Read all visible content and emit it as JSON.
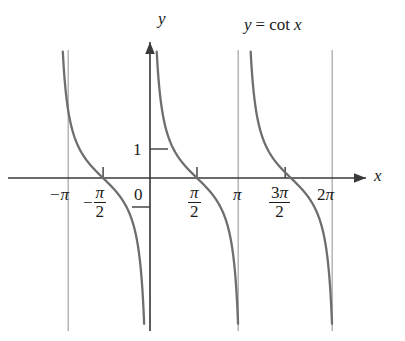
{
  "figure": {
    "background_color": "#ffffff",
    "curve_color": "#6e6e6e",
    "asymptote_color": "#a9a9a9",
    "axis_color": "#3a3a3a",
    "text_color": "#1a1a1a"
  },
  "labels": {
    "function_label": "y = cot x",
    "function_label_lhs": "y",
    "function_label_eq": "=",
    "function_label_rhs": "cot",
    "function_label_var": "x",
    "y_axis_name": "y",
    "x_axis_name": "x",
    "origin": "0",
    "y_tick_one": "1"
  },
  "chart_data": {
    "type": "line",
    "xlabel": "x",
    "ylabel": "y",
    "xlim": [
      -3.7699,
      7.5398
    ],
    "ylim": [
      -3.5,
      3.5
    ],
    "grid": false,
    "legend": "none",
    "x_tick_labels": [
      "-π",
      "-π/2",
      "0",
      "π/2",
      "π",
      "3π/2",
      "2π"
    ],
    "x_tick_values": [
      -3.14159,
      -1.5708,
      0,
      1.5708,
      3.14159,
      4.71239,
      6.28319
    ],
    "x_ticks_drawn_at": [
      -1.5708,
      1.5708,
      4.71239
    ],
    "y_tick_labels": [
      "1"
    ],
    "y_tick_values": [
      1
    ],
    "y_ticks_drawn_at": [
      1,
      -1
    ],
    "asymptotes": [
      -3.14159,
      0,
      3.14159,
      6.28319
    ],
    "zeros": [
      -1.5708,
      1.5708,
      4.71239
    ],
    "branches": [
      {
        "domain": [
          -3.14159,
          0
        ],
        "note": "decreasing from +infinity to -infinity, crosses zero at -pi/2"
      },
      {
        "domain": [
          0,
          3.14159
        ],
        "note": "decreasing from +infinity to -infinity, crosses zero at pi/2"
      },
      {
        "domain": [
          3.14159,
          6.28319
        ],
        "note": "decreasing from +infinity to -infinity, crosses zero at 3pi/2"
      }
    ],
    "annotations": [
      {
        "text": "y = cot x",
        "x": 4.6,
        "y": 3.3
      }
    ]
  },
  "geometry": {
    "x_axis_y_px": 178,
    "y_axis_x_px": 150,
    "px_per_unit_x": 29.9,
    "px_per_unit_y": 29.0,
    "asymptote_top_px": 50,
    "asymptote_bottom_px": 331
  }
}
